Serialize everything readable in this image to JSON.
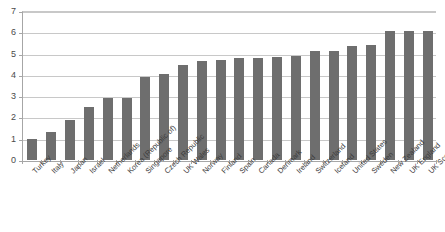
{
  "chart_data": {
    "type": "bar",
    "title": "",
    "xlabel": "",
    "ylabel": "",
    "ylim": [
      0,
      7
    ],
    "yticks": [
      0,
      1,
      2,
      3,
      4,
      5,
      6,
      7
    ],
    "grid": true,
    "legend": "none",
    "orientation": "vertical",
    "bar_color": "#6e6e6e",
    "categories": [
      "Turkey",
      "Italy",
      "Japan",
      "Israel",
      "Netherlands",
      "Korea (Republic of)",
      "Singapore",
      "Czech Republic",
      "UK Wales",
      "Norway",
      "Finland",
      "Spain",
      "Canada",
      "Denmark",
      "Ireland",
      "Switzerland",
      "Iceland",
      "United States",
      "Sweden",
      "New Zealand",
      "UK England",
      "UK Scotland"
    ],
    "values": [
      1.0,
      1.3,
      1.9,
      2.5,
      2.9,
      2.9,
      3.9,
      4.05,
      4.45,
      4.65,
      4.7,
      4.8,
      4.8,
      4.85,
      4.9,
      5.1,
      5.1,
      5.35,
      5.4,
      6.05,
      6.05,
      6.05
    ]
  },
  "axis": {
    "y_tick_labels": [
      "0",
      "1",
      "2",
      "3",
      "4",
      "5",
      "6",
      "7"
    ]
  },
  "title_remnant": ""
}
